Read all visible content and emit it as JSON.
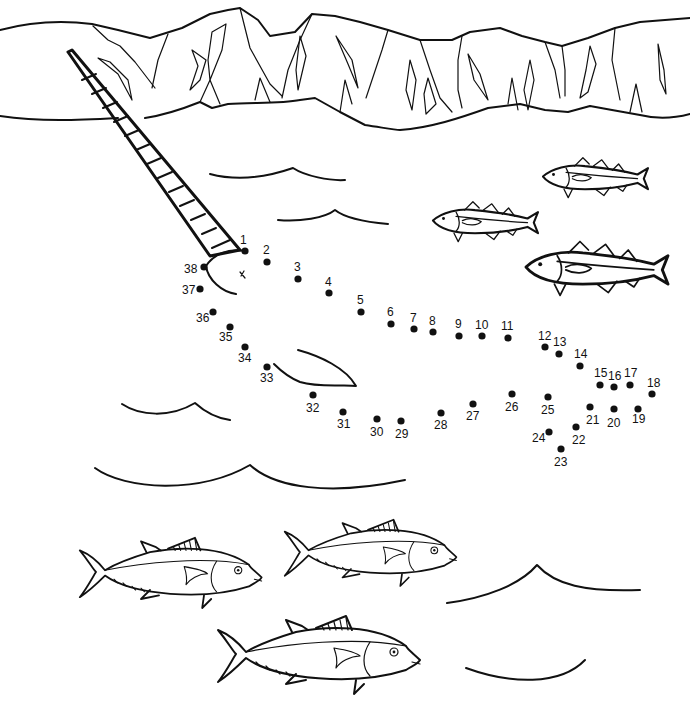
{
  "worksheet": {
    "type": "connect-the-dots",
    "subject": "narwhal",
    "dot_color": "#111111",
    "line_color": "#111111",
    "background": "#ffffff"
  },
  "dots": [
    {
      "n": "1",
      "x": 245,
      "y": 251,
      "lx": 240,
      "ly": 244
    },
    {
      "n": "2",
      "x": 267,
      "y": 262,
      "lx": 263,
      "ly": 254
    },
    {
      "n": "3",
      "x": 298,
      "y": 279,
      "lx": 294,
      "ly": 271
    },
    {
      "n": "4",
      "x": 329,
      "y": 293,
      "lx": 325,
      "ly": 286
    },
    {
      "n": "5",
      "x": 361,
      "y": 312,
      "lx": 357,
      "ly": 304
    },
    {
      "n": "6",
      "x": 391,
      "y": 324,
      "lx": 387,
      "ly": 316
    },
    {
      "n": "7",
      "x": 414,
      "y": 329,
      "lx": 410,
      "ly": 322
    },
    {
      "n": "8",
      "x": 433,
      "y": 332,
      "lx": 429,
      "ly": 325
    },
    {
      "n": "9",
      "x": 459,
      "y": 336,
      "lx": 455,
      "ly": 328
    },
    {
      "n": "10",
      "x": 482,
      "y": 336,
      "lx": 475,
      "ly": 329
    },
    {
      "n": "11",
      "x": 508,
      "y": 338,
      "lx": 501,
      "ly": 330
    },
    {
      "n": "12",
      "x": 545,
      "y": 347,
      "lx": 538,
      "ly": 340
    },
    {
      "n": "13",
      "x": 559,
      "y": 354,
      "lx": 553,
      "ly": 346
    },
    {
      "n": "14",
      "x": 580,
      "y": 366,
      "lx": 574,
      "ly": 358
    },
    {
      "n": "15",
      "x": 600,
      "y": 385,
      "lx": 594,
      "ly": 377
    },
    {
      "n": "16",
      "x": 614,
      "y": 387,
      "lx": 608,
      "ly": 380
    },
    {
      "n": "17",
      "x": 630,
      "y": 385,
      "lx": 624,
      "ly": 377
    },
    {
      "n": "18",
      "x": 652,
      "y": 394,
      "lx": 647,
      "ly": 387
    },
    {
      "n": "19",
      "x": 638,
      "y": 409,
      "lx": 632,
      "ly": 423
    },
    {
      "n": "20",
      "x": 614,
      "y": 409,
      "lx": 607,
      "ly": 427
    },
    {
      "n": "21",
      "x": 590,
      "y": 407,
      "lx": 586,
      "ly": 424
    },
    {
      "n": "22",
      "x": 576,
      "y": 427,
      "lx": 572,
      "ly": 444
    },
    {
      "n": "23",
      "x": 561,
      "y": 449,
      "lx": 554,
      "ly": 466
    },
    {
      "n": "24",
      "x": 549,
      "y": 432,
      "lx": 532,
      "ly": 442
    },
    {
      "n": "25",
      "x": 548,
      "y": 397,
      "lx": 541,
      "ly": 414
    },
    {
      "n": "26",
      "x": 512,
      "y": 394,
      "lx": 505,
      "ly": 411
    },
    {
      "n": "27",
      "x": 473,
      "y": 404,
      "lx": 466,
      "ly": 420
    },
    {
      "n": "28",
      "x": 441,
      "y": 413,
      "lx": 434,
      "ly": 429
    },
    {
      "n": "29",
      "x": 401,
      "y": 421,
      "lx": 395,
      "ly": 438
    },
    {
      "n": "30",
      "x": 377,
      "y": 419,
      "lx": 370,
      "ly": 436
    },
    {
      "n": "31",
      "x": 343,
      "y": 412,
      "lx": 337,
      "ly": 428
    },
    {
      "n": "32",
      "x": 313,
      "y": 395,
      "lx": 306,
      "ly": 412
    },
    {
      "n": "33",
      "x": 267,
      "y": 367,
      "lx": 260,
      "ly": 382
    },
    {
      "n": "34",
      "x": 245,
      "y": 347,
      "lx": 238,
      "ly": 362
    },
    {
      "n": "35",
      "x": 230,
      "y": 327,
      "lx": 219,
      "ly": 341
    },
    {
      "n": "36",
      "x": 213,
      "y": 312,
      "lx": 196,
      "ly": 322
    },
    {
      "n": "37",
      "x": 200,
      "y": 289,
      "lx": 182,
      "ly": 294
    },
    {
      "n": "38",
      "x": 204,
      "y": 267,
      "lx": 184,
      "ly": 273
    }
  ],
  "illustration": {
    "mountains": "iceberg-range",
    "narwhal_parts": [
      "tusk",
      "head-outline",
      "eye",
      "flipper"
    ],
    "cod_fish_count": 3,
    "tuna_fish_count": 3,
    "wave_count": 6
  }
}
